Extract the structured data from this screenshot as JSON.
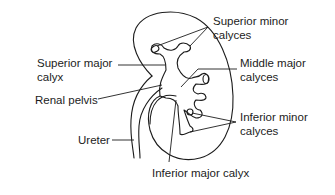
{
  "diagram": {
    "labels": {
      "superior_minor_calyces": [
        "Superior minor",
        "calyces"
      ],
      "superior_major_calyx": [
        "Superior major",
        "calyx"
      ],
      "middle_major_calyces": [
        "Middle major",
        "calyces"
      ],
      "renal_pelvis": [
        "Renal pelvis"
      ],
      "inferior_minor_calyces": [
        "Inferior minor",
        "calyces"
      ],
      "ureter": [
        "Ureter"
      ],
      "inferior_major_calyx": [
        "Inferior major calyx"
      ]
    },
    "colors": {
      "line": "#1c1c1c",
      "background": "#ffffff"
    }
  }
}
